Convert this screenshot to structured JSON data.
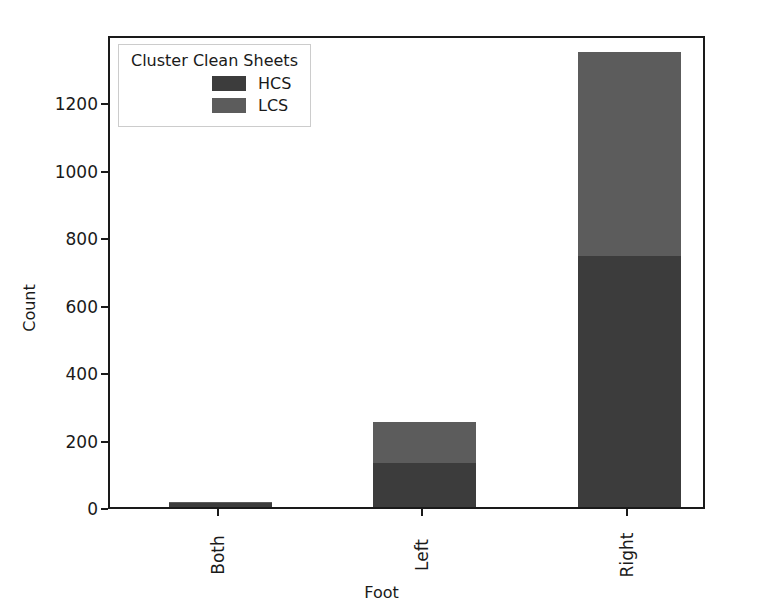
{
  "chart_data": {
    "type": "bar",
    "subtype": "stacked-vertical",
    "title": "",
    "xlabel": "Foot",
    "ylabel": "Count",
    "categories": [
      "Both",
      "Left",
      "Right"
    ],
    "series": [
      {
        "name": "HCS",
        "values": [
          13,
          130,
          744
        ],
        "color": "#3c3c3c"
      },
      {
        "name": "LCS",
        "values": [
          1,
          122,
          604
        ],
        "color": "#5c5c5c"
      }
    ],
    "totals": [
      14,
      252,
      1348
    ],
    "ylim": [
      0,
      1402
    ],
    "yticks": [
      0,
      200,
      400,
      600,
      800,
      1000,
      1200
    ],
    "ytick_labels": [
      "0",
      "200",
      "400",
      "600",
      "800",
      "1000",
      "1200"
    ],
    "xtick_labels": [
      "Both",
      "Left",
      "Right"
    ],
    "xtick_rotation": 90,
    "grid": false,
    "legend": {
      "title": "Cluster Clean Sheets",
      "position": "upper-left-inside",
      "entries": [
        {
          "label": "HCS",
          "color": "#3c3c3c"
        },
        {
          "label": "LCS",
          "color": "#5c5c5c"
        }
      ]
    },
    "axis_frame": true,
    "background_color": "#ffffff",
    "axis_color": "#1a1a1a"
  }
}
